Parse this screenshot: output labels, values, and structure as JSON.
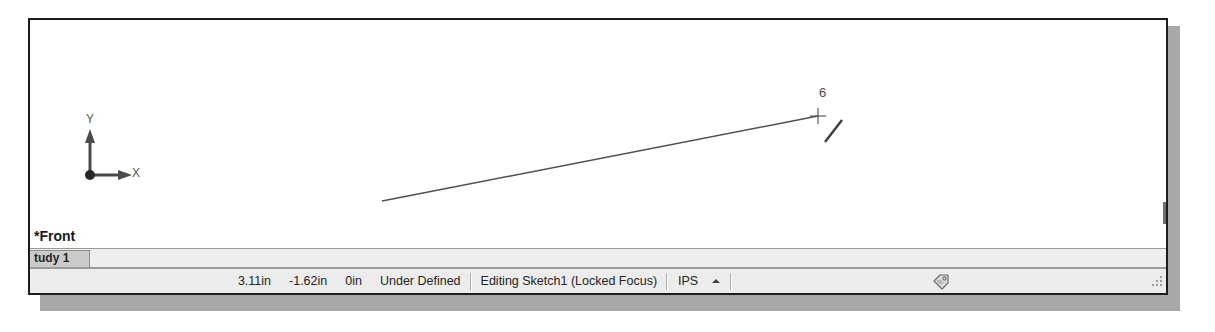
{
  "window": {
    "graphics_area_name": "graphics-area",
    "view_label": "*Front",
    "background_color": "#ffffff",
    "border_color": "#1d1d1d"
  },
  "triad": {
    "x_label": "X",
    "y_label": "Y"
  },
  "sketch": {
    "dimension_value": "6",
    "line": {
      "x1": 352,
      "y1": 181,
      "x2": 788,
      "y2": 96
    },
    "point_marker": {
      "x": 788,
      "y": 96
    },
    "cursor_glyph": {
      "x1": 795,
      "y1": 122,
      "x2": 812,
      "y2": 100
    }
  },
  "tabs": {
    "items": [
      {
        "label": "tudy 1",
        "active": true
      }
    ]
  },
  "status_bar": {
    "coord_x": "3.11in",
    "coord_y": "-1.62in",
    "coord_z": "0in",
    "sketch_state": "Under Defined",
    "editing_state": "Editing Sketch1 (Locked Focus)",
    "units": "IPS",
    "units_caret": "caret-up-icon",
    "tag_icon": "tag-icon",
    "resize_grip": "resize-grip-icon"
  },
  "colors": {
    "canvas": "#ffffff",
    "chrome": "#ececec",
    "tab_active": "#cbcbcb",
    "border": "#9a9a9a",
    "text": "#242424",
    "sketch_line": "#555555"
  }
}
